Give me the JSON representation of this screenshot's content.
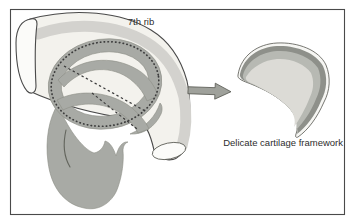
{
  "figure": {
    "labels": {
      "rib": "7th rib",
      "framework": "Delicate cartilage framework"
    },
    "icons": {
      "arrow": "arrow-right"
    },
    "colors": {
      "background": "#ffffff",
      "outline": "#4a4a4a",
      "rib_fill": "#f3f2ed",
      "rib_shading": "#d3d2ce",
      "cut_surface": "#fbfbf9",
      "template_gray": "#a8aaa5",
      "cut_line": "#3c3c3c",
      "arrow_fill": "#9fa19b",
      "framework_rim": "#f6f6f3",
      "framework_dark": "#8e908a",
      "framework_mid": "#b7b9b3",
      "framework_light": "#dcdbd6"
    }
  }
}
